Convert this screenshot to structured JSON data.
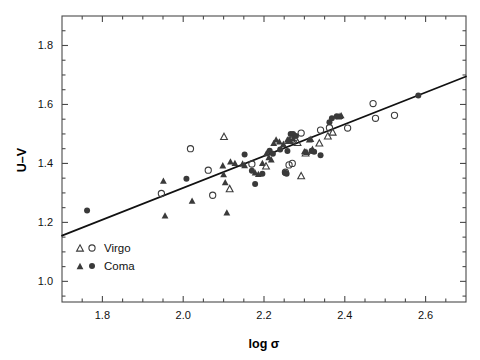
{
  "chart_data": {
    "type": "scatter",
    "title": "",
    "xlabel": "log σ",
    "ylabel": "U–V",
    "xlim": [
      1.7,
      2.7
    ],
    "ylim": [
      0.93,
      1.9
    ],
    "xticks": [
      1.8,
      2.0,
      2.2,
      2.4,
      2.6
    ],
    "xticklabels": [
      "1.8",
      "2.0",
      "2.2",
      "2.4",
      "2.6"
    ],
    "yticks": [
      1.0,
      1.2,
      1.4,
      1.6,
      1.8
    ],
    "yticklabels": [
      "1.0",
      "1.2",
      "1.4",
      "1.6",
      "1.8"
    ],
    "x_minor_ticks": [
      1.75,
      1.85,
      1.9,
      1.95,
      2.05,
      2.1,
      2.15,
      2.25,
      2.3,
      2.35,
      2.45,
      2.5,
      2.55,
      2.65
    ],
    "y_minor_ticks": [
      0.95,
      1.05,
      1.1,
      1.15,
      1.25,
      1.3,
      1.35,
      1.45,
      1.5,
      1.55,
      1.65,
      1.7,
      1.75,
      1.85
    ],
    "grid": false,
    "legend_position": "lower-left",
    "legend": [
      {
        "label": "Virgo",
        "markers": [
          "open-triangle",
          "open-circle"
        ]
      },
      {
        "label": "Coma",
        "markers": [
          "filled-triangle",
          "filled-circle"
        ]
      }
    ],
    "fit_line": {
      "x": [
        1.7,
        2.7
      ],
      "y": [
        1.155,
        1.695
      ],
      "slope": 0.54,
      "intercept": 0.237
    },
    "series": [
      {
        "name": "Virgo open triangle",
        "marker": "open-triangle",
        "points": [
          [
            2.101,
            1.49
          ],
          [
            2.115,
            1.313
          ],
          [
            2.205,
            1.39
          ],
          [
            2.262,
            1.477
          ],
          [
            2.283,
            1.47
          ],
          [
            2.292,
            1.357
          ],
          [
            2.303,
            1.434
          ],
          [
            2.32,
            1.444
          ],
          [
            2.337,
            1.468
          ],
          [
            2.358,
            1.492
          ],
          [
            2.37,
            1.505
          ]
        ]
      },
      {
        "name": "Virgo open circle",
        "marker": "open-circle",
        "points": [
          [
            1.946,
            1.298
          ],
          [
            2.018,
            1.45
          ],
          [
            2.062,
            1.377
          ],
          [
            2.073,
            1.292
          ],
          [
            2.17,
            1.398
          ],
          [
            2.253,
            1.37
          ],
          [
            2.262,
            1.395
          ],
          [
            2.268,
            1.478
          ],
          [
            2.27,
            1.4
          ],
          [
            2.292,
            1.503
          ],
          [
            2.34,
            1.513
          ],
          [
            2.362,
            1.521
          ],
          [
            2.407,
            1.52
          ],
          [
            2.47,
            1.603
          ],
          [
            2.476,
            1.553
          ],
          [
            2.523,
            1.563
          ]
        ]
      },
      {
        "name": "Coma filled triangle",
        "marker": "filled-triangle",
        "points": [
          [
            1.951,
            1.34
          ],
          [
            1.955,
            1.222
          ],
          [
            2.022,
            1.272
          ],
          [
            2.098,
            1.392
          ],
          [
            2.1,
            1.362
          ],
          [
            2.104,
            1.335
          ],
          [
            2.108,
            1.232
          ],
          [
            2.117,
            1.405
          ],
          [
            2.128,
            1.4
          ],
          [
            2.147,
            1.398
          ],
          [
            2.152,
            1.393
          ],
          [
            2.178,
            1.368
          ],
          [
            2.186,
            1.363
          ],
          [
            2.196,
            1.4
          ],
          [
            2.206,
            1.433
          ],
          [
            2.212,
            1.42
          ],
          [
            2.218,
            1.412
          ],
          [
            2.224,
            1.468
          ],
          [
            2.23,
            1.48
          ],
          [
            2.238,
            1.473
          ],
          [
            2.248,
            1.465
          ],
          [
            2.258,
            1.48
          ],
          [
            2.264,
            1.478
          ],
          [
            2.272,
            1.483
          ],
          [
            2.3,
            1.44
          ],
          [
            2.306,
            1.438
          ],
          [
            2.312,
            1.48
          ],
          [
            2.316,
            1.482
          ],
          [
            2.385,
            1.558
          ],
          [
            2.388,
            1.56
          ],
          [
            2.391,
            1.562
          ]
        ]
      },
      {
        "name": "Coma filled circle",
        "marker": "filled-circle",
        "points": [
          [
            1.762,
            1.24
          ],
          [
            2.008,
            1.348
          ],
          [
            2.152,
            1.43
          ],
          [
            2.17,
            1.375
          ],
          [
            2.178,
            1.33
          ],
          [
            2.196,
            1.365
          ],
          [
            2.214,
            1.443
          ],
          [
            2.222,
            1.433
          ],
          [
            2.24,
            1.447
          ],
          [
            2.252,
            1.368
          ],
          [
            2.256,
            1.365
          ],
          [
            2.258,
            1.442
          ],
          [
            2.266,
            1.5
          ],
          [
            2.272,
            1.5
          ],
          [
            2.279,
            1.493
          ],
          [
            2.318,
            1.443
          ],
          [
            2.324,
            1.44
          ],
          [
            2.34,
            1.428
          ],
          [
            2.362,
            1.54
          ],
          [
            2.368,
            1.553
          ],
          [
            2.38,
            1.56
          ],
          [
            2.582,
            1.63
          ]
        ]
      }
    ]
  }
}
